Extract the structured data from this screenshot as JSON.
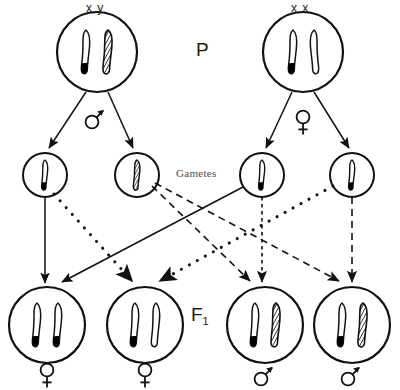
{
  "diagram": {
    "labels": {
      "parent_generation": "P",
      "f1_generation": "F",
      "f1_subscript": "1",
      "gametes": "Gametes",
      "parent_male_genotype": "x y",
      "parent_female_genotype": "x x",
      "symbol_male": "male-symbol",
      "symbol_female": "female-symbol"
    },
    "colors": {
      "ink": "#111111",
      "gamete_label": "#4d4d4d",
      "chromosome_fill": "#ffffff",
      "chromosome_band": "#000000",
      "background": "#ffffff"
    },
    "parents": [
      {
        "id": "parent-male",
        "genotype": "x y",
        "sex": "male",
        "cx": 97,
        "cy": 52,
        "r": 40,
        "chromosomes": [
          "X",
          "Y"
        ]
      },
      {
        "id": "parent-female",
        "genotype": "x x",
        "sex": "female",
        "cx": 303,
        "cy": 52,
        "r": 40,
        "chromosomes": [
          "X",
          "X"
        ]
      }
    ],
    "gametes": [
      {
        "id": "gamete-1",
        "type": "X",
        "cx": 45,
        "cy": 175,
        "r": 22,
        "from": "parent-male"
      },
      {
        "id": "gamete-2",
        "type": "Y",
        "cx": 137,
        "cy": 175,
        "r": 22,
        "from": "parent-male"
      },
      {
        "id": "gamete-3",
        "type": "X",
        "cx": 262,
        "cy": 175,
        "r": 22,
        "from": "parent-female"
      },
      {
        "id": "gamete-4",
        "type": "X",
        "cx": 352,
        "cy": 175,
        "r": 22,
        "from": "parent-female"
      }
    ],
    "offspring": [
      {
        "id": "f1-1",
        "genotype": "XX",
        "sex": "female",
        "cx": 47,
        "cy": 325,
        "r": 38,
        "chromosomes": [
          "X",
          "X"
        ]
      },
      {
        "id": "f1-2",
        "genotype": "XX",
        "sex": "female",
        "cx": 145,
        "cy": 325,
        "r": 38,
        "chromosomes": [
          "X",
          "X"
        ]
      },
      {
        "id": "f1-3",
        "genotype": "XY",
        "sex": "male",
        "cx": 265,
        "cy": 325,
        "r": 38,
        "chromosomes": [
          "X",
          "Y"
        ]
      },
      {
        "id": "f1-4",
        "genotype": "XY",
        "sex": "male",
        "cx": 352,
        "cy": 325,
        "r": 38,
        "chromosomes": [
          "X",
          "Y"
        ]
      }
    ],
    "crosses": [
      {
        "id": "cross-g1-f1-1",
        "from": "gamete-1",
        "to": "f1-1",
        "style": "solid"
      },
      {
        "id": "cross-g1-f1-2",
        "from": "gamete-1",
        "to": "f1-2",
        "style": "dotted"
      },
      {
        "id": "cross-g2-f1-3",
        "from": "gamete-2",
        "to": "f1-3",
        "style": "dashed"
      },
      {
        "id": "cross-g2-f1-4",
        "from": "gamete-2",
        "to": "f1-4",
        "style": "dashed"
      },
      {
        "id": "cross-g3-f1-1",
        "from": "gamete-3",
        "to": "f1-1",
        "style": "solid"
      },
      {
        "id": "cross-g3-f1-3",
        "from": "gamete-3",
        "to": "f1-3",
        "style": "dotted-fine"
      },
      {
        "id": "cross-g4-f1-2",
        "from": "gamete-4",
        "to": "f1-2",
        "style": "dotted"
      },
      {
        "id": "cross-g4-f1-4",
        "from": "gamete-4",
        "to": "f1-4",
        "style": "dashed"
      }
    ]
  }
}
